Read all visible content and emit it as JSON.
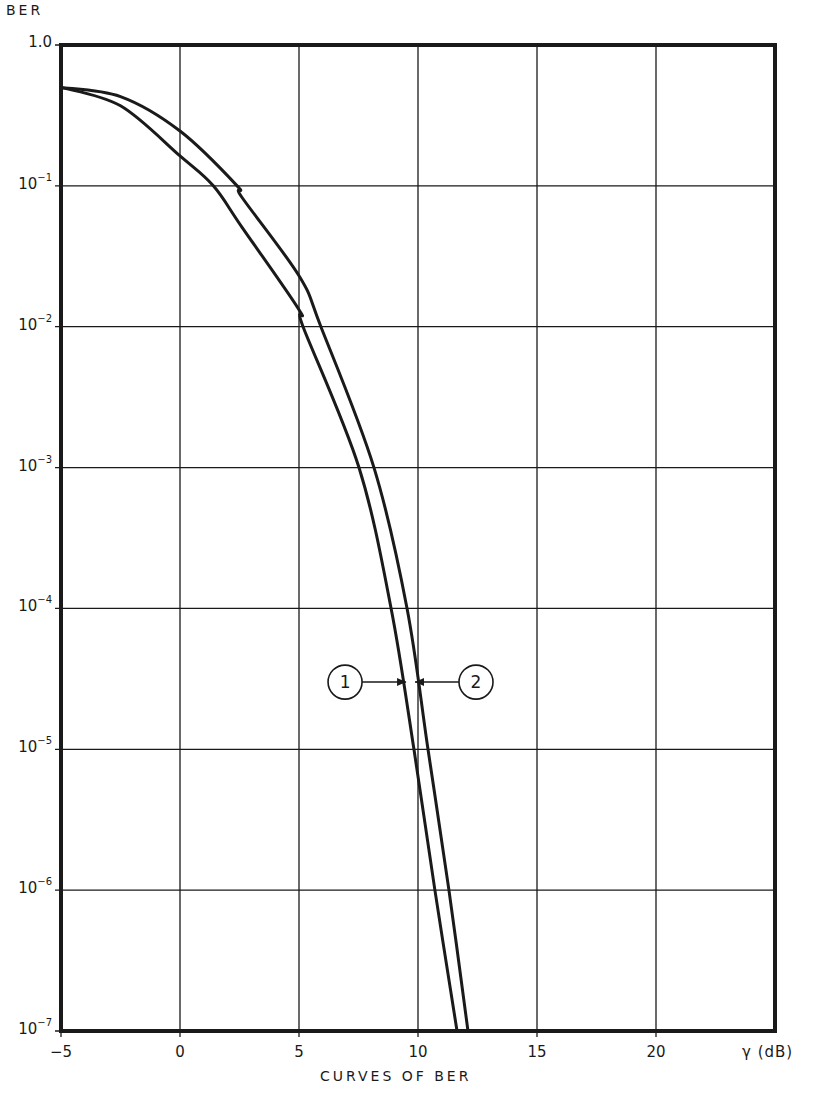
{
  "chart_data": {
    "type": "line",
    "title": "",
    "xlabel": "CURVES OF BER",
    "x_unit_label": "γ (dB)",
    "ylabel": "BER",
    "xscale": "linear",
    "yscale": "log",
    "xlim": [
      -5,
      25
    ],
    "ylim": [
      1e-07,
      1.0
    ],
    "grid": true,
    "x_ticks": [
      -5,
      0,
      5,
      10,
      15,
      20
    ],
    "x_tick_labels": [
      "−5",
      "0",
      "5",
      "10",
      "15",
      "20"
    ],
    "y_ticks": [
      1.0,
      0.1,
      0.01,
      0.001,
      0.0001,
      1e-05,
      1e-06,
      1e-07
    ],
    "y_tick_labels": [
      {
        "base": "1.0",
        "exp": ""
      },
      {
        "base": "10",
        "exp": "−1"
      },
      {
        "base": "10",
        "exp": "−2"
      },
      {
        "base": "10",
        "exp": "−3"
      },
      {
        "base": "10",
        "exp": "−4"
      },
      {
        "base": "10",
        "exp": "−5"
      },
      {
        "base": "10",
        "exp": "−6"
      },
      {
        "base": "10",
        "exp": "−7"
      }
    ],
    "series": [
      {
        "name": "1",
        "x": [
          -5,
          -2.5,
          0,
          1.4,
          2.6,
          5,
          5.17,
          7.52,
          8.87,
          9.83,
          10.71,
          11.64
        ],
        "y": [
          0.5,
          0.37,
          0.163,
          0.1,
          0.051,
          0.0132,
          0.01,
          0.001,
          0.0001,
          1e-05,
          1e-06,
          1e-07
        ]
      },
      {
        "name": "2",
        "x": [
          -5,
          -2.5,
          0,
          2.4,
          2.6,
          5,
          5.92,
          8.15,
          9.54,
          10.42,
          11.3,
          12.1
        ],
        "y": [
          0.5,
          0.43,
          0.245,
          0.1,
          0.083,
          0.023,
          0.01,
          0.001,
          0.0001,
          1e-05,
          1e-06,
          1e-07
        ]
      }
    ],
    "annotations": [
      {
        "label": "1",
        "points_to_series": "1",
        "at_y": 3e-05,
        "side": "left"
      },
      {
        "label": "2",
        "points_to_series": "2",
        "at_y": 3e-05,
        "side": "right"
      }
    ],
    "line_color": "#1a1a1a"
  }
}
